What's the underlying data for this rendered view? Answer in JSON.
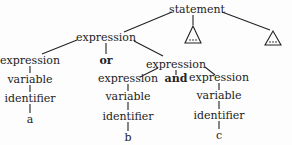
{
  "tree": {
    "root": {
      "label": "statement"
    },
    "subtree_placeholder": {
      "label": "..."
    },
    "nodes": {
      "expr_top": {
        "label": "expression"
      },
      "expr_left": {
        "label": "expression"
      },
      "or": {
        "label": "or"
      },
      "expr_right": {
        "label": "expression"
      },
      "var_a": {
        "label": "variable"
      },
      "id_a": {
        "label": "identifier"
      },
      "leaf_a": {
        "label": "a"
      },
      "expr_b": {
        "label": "expression"
      },
      "and": {
        "label": "and"
      },
      "expr_c": {
        "label": "expression"
      },
      "var_b": {
        "label": "variable"
      },
      "id_b": {
        "label": "identifier"
      },
      "leaf_b": {
        "label": "b"
      },
      "var_c": {
        "label": "variable"
      },
      "id_c": {
        "label": "identifier"
      },
      "leaf_c": {
        "label": "c"
      }
    }
  },
  "colors": {
    "ink": "#222222",
    "background": "#fdfdfd"
  }
}
